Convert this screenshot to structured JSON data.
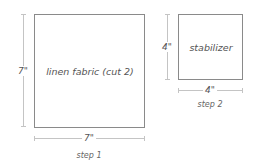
{
  "diagram": {
    "steps": [
      {
        "step_label": "step 1",
        "piece_label": "linen fabric (cut 2)",
        "height_label": "7\"",
        "width_label": "7\""
      },
      {
        "step_label": "step 2",
        "piece_label": "stabilizer",
        "height_label": "4\"",
        "width_label": "4\""
      }
    ],
    "colors": {
      "box_border": "#8a8a8a",
      "dimension_line": "#c4c4c4",
      "text": "#555555"
    }
  }
}
